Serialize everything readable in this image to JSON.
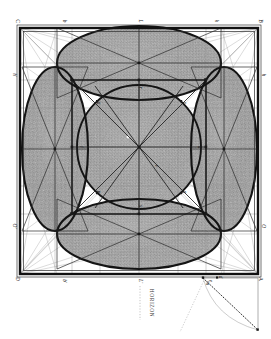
{
  "plate": {
    "title": "Perspective construction of a cube with inscribed circles",
    "medium": "engraving",
    "orientation_deg": 90,
    "background_color": "#ffffff",
    "ink_color": "#1a1a1a",
    "shade_color": "#9a9a9a",
    "caption": "HORIZON"
  },
  "frame": {
    "outer": {
      "x": 20,
      "y": 28,
      "width": 238,
      "height": 246
    },
    "border_width_px": 2.2,
    "corner_labels": [
      {
        "id": "C",
        "text": "C",
        "x": 16,
        "y": 21,
        "corner": "top-left"
      },
      {
        "id": "B",
        "text": "B",
        "x": 259,
        "y": 21,
        "corner": "top-right"
      },
      {
        "id": "D",
        "text": "D",
        "x": 16,
        "y": 279,
        "corner": "bottom-left"
      },
      {
        "id": "A",
        "text": "A",
        "x": 259,
        "y": 279,
        "corner": "bottom-right"
      }
    ]
  },
  "edge_labels": {
    "top": [
      {
        "text": "b",
        "x": 63,
        "y": 21
      },
      {
        "text": "L",
        "x": 139,
        "y": 21
      },
      {
        "text": "k",
        "x": 215,
        "y": 21
      }
    ],
    "bottom": [
      {
        "text": "b'",
        "x": 63,
        "y": 281
      },
      {
        "text": "L'",
        "x": 139,
        "y": 281
      },
      {
        "text": "e",
        "x": 209,
        "y": 281
      }
    ],
    "left": [
      {
        "text": "h'",
        "x": 13,
        "y": 75
      },
      {
        "text": "O'",
        "x": 13,
        "y": 226
      }
    ],
    "right": [
      {
        "text": "h",
        "x": 262,
        "y": 75
      },
      {
        "text": "O",
        "x": 262,
        "y": 226
      }
    ]
  },
  "inner_square": {
    "x": 72,
    "y": 80,
    "width": 134,
    "height": 134,
    "label_corners": [
      "f",
      "g",
      "i",
      "n"
    ]
  },
  "center_circle": {
    "cx": 139,
    "cy": 147,
    "r": 62,
    "label": "o"
  },
  "ellipses": [
    {
      "name": "top-ellipse",
      "cx": 139,
      "cy": 63,
      "rx": 82,
      "ry": 37,
      "rotation": 0
    },
    {
      "name": "bottom-ellipse",
      "cx": 139,
      "cy": 234,
      "rx": 82,
      "ry": 35,
      "rotation": 0
    },
    {
      "name": "left-ellipse",
      "cx": 55,
      "cy": 149,
      "rx": 33,
      "ry": 82,
      "rotation": 0
    },
    {
      "name": "right-ellipse",
      "cx": 224,
      "cy": 149,
      "rx": 33,
      "ry": 82,
      "rotation": 0
    }
  ],
  "horizon": {
    "label": "HORIZON",
    "x": 150,
    "y": 303,
    "dotted_line": true
  },
  "measuring_triangle": {
    "apex_top": {
      "x": 203,
      "y": 278
    },
    "apex_right": {
      "x": 258,
      "y": 330
    },
    "arc": true,
    "dotted_ray": true,
    "labels": [
      {
        "text": "m",
        "x": 206,
        "y": 283
      },
      {
        "text": "d",
        "x": 219,
        "y": 277
      }
    ]
  },
  "interior_points": [
    {
      "text": "a",
      "x": 97,
      "y": 103
    },
    {
      "text": "c",
      "x": 183,
      "y": 103
    },
    {
      "text": "p",
      "x": 97,
      "y": 192
    },
    {
      "text": "q",
      "x": 183,
      "y": 192
    },
    {
      "text": "r",
      "x": 139,
      "y": 88
    },
    {
      "text": "s",
      "x": 139,
      "y": 206
    },
    {
      "text": "t",
      "x": 80,
      "y": 147
    },
    {
      "text": "u",
      "x": 198,
      "y": 147
    },
    {
      "text": "v",
      "x": 155,
      "y": 166
    }
  ]
}
